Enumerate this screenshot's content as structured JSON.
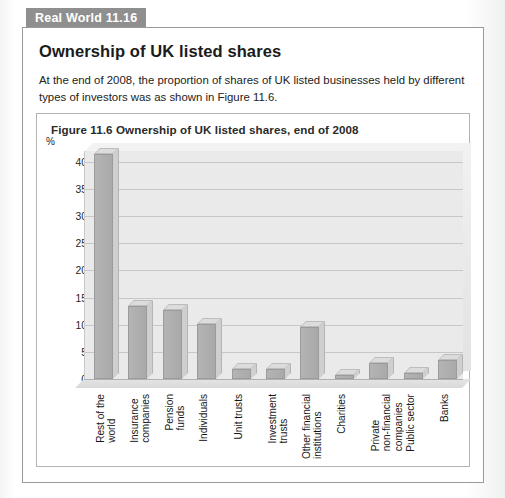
{
  "badge": {
    "label": "Real World 11.16"
  },
  "article": {
    "headline": "Ownership of UK listed shares",
    "body": "At the end of 2008, the proportion of shares of UK listed businesses held by different types of investors was as shown in Figure 11.6."
  },
  "figure": {
    "title": "Figure 11.6  Ownership of UK listed shares, end of 2008"
  },
  "chart_data": {
    "type": "bar",
    "title": "Figure 11.6  Ownership of UK listed shares, end of 2008",
    "xlabel": "",
    "ylabel": "%",
    "ylim": [
      0,
      42
    ],
    "yticks": [
      0,
      5,
      10,
      15,
      20,
      25,
      30,
      35,
      40
    ],
    "ytick_labels": [
      "0",
      "5",
      "10",
      "15",
      "20",
      "25",
      "30",
      "35",
      "40"
    ],
    "grid": true,
    "legend": "none",
    "categories": [
      "Rest of the\nworld",
      "Insurance\ncompanies",
      "Pension\nfunds",
      "Individuals",
      "Unit trusts",
      "Investment\ntrusts",
      "Other financial\ninstitutions",
      "Charities",
      "Private\nnon-financial\ncompanies",
      "Public sector",
      "Banks"
    ],
    "values": [
      41.5,
      13.4,
      12.8,
      10.2,
      1.8,
      1.9,
      9.6,
      0.8,
      3.0,
      1.1,
      3.5
    ],
    "bar_color": "#b0b0b0",
    "plot_background": "#eaeaea"
  }
}
